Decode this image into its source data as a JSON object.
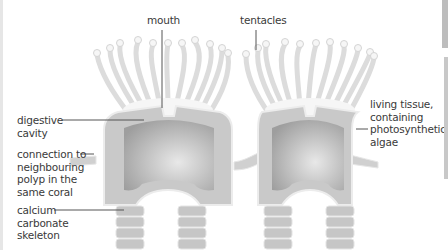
{
  "diagram": {
    "labels": {
      "mouth": "mouth",
      "tentacles": "tentacles",
      "digestive_cavity": "digestive\ncavity",
      "connection": "connection to\nneighbouring\npolyp in the\nsame coral",
      "skeleton": "calcium\ncarbonate\nskeleton",
      "living_tissue": "living tissue,\ncontaining\nphotosynthetic\nalgae"
    },
    "colors": {
      "tentacle_fill": "#efefef",
      "tentacle_stroke": "#d6d6d6",
      "tissue": "#c8c8c8",
      "cavity": "#a9a9a9",
      "skeleton": "#c4c4c4",
      "leader_line": "#555555",
      "scrollbar": "#bdbdbd"
    }
  }
}
